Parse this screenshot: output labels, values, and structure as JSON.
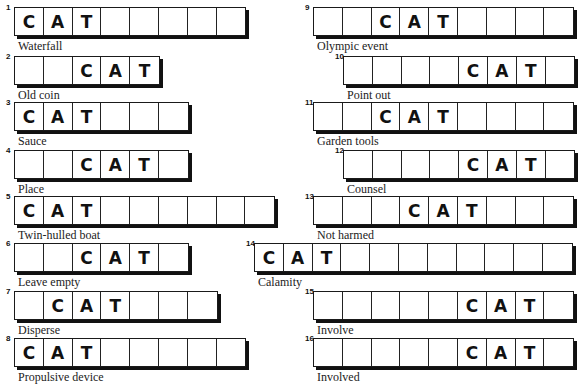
{
  "puzzle": {
    "entries": [
      {
        "number": "1",
        "clue": "Waterfall",
        "length": 8,
        "cat_start": 0,
        "x": 14,
        "y": 7
      },
      {
        "number": "2",
        "clue": "Old coin",
        "length": 5,
        "cat_start": 2,
        "x": 14,
        "y": 56
      },
      {
        "number": "3",
        "clue": "Sauce",
        "length": 6,
        "cat_start": 0,
        "x": 14,
        "y": 102
      },
      {
        "number": "4",
        "clue": "Place",
        "length": 6,
        "cat_start": 2,
        "x": 14,
        "y": 150
      },
      {
        "number": "5",
        "clue": "Twin-hulled boat",
        "length": 9,
        "cat_start": 0,
        "x": 14,
        "y": 196
      },
      {
        "number": "6",
        "clue": "Leave empty",
        "length": 6,
        "cat_start": 2,
        "x": 14,
        "y": 243
      },
      {
        "number": "7",
        "clue": "Disperse",
        "length": 7,
        "cat_start": 1,
        "x": 14,
        "y": 291
      },
      {
        "number": "8",
        "clue": "Propulsive device",
        "length": 8,
        "cat_start": 0,
        "x": 14,
        "y": 338
      },
      {
        "number": "9",
        "clue": "Olympic event",
        "length": 9,
        "cat_start": 2,
        "x": 313,
        "y": 7
      },
      {
        "number": "10",
        "clue": "Point out",
        "length": 8,
        "cat_start": 4,
        "x": 343,
        "y": 56
      },
      {
        "number": "11",
        "clue": "Garden tools",
        "length": 9,
        "cat_start": 2,
        "x": 313,
        "y": 102
      },
      {
        "number": "12",
        "clue": "Counsel",
        "length": 8,
        "cat_start": 4,
        "x": 343,
        "y": 150
      },
      {
        "number": "13",
        "clue": "Not harmed",
        "length": 9,
        "cat_start": 3,
        "x": 313,
        "y": 196
      },
      {
        "number": "14",
        "clue": "Calamity",
        "length": 11,
        "cat_start": 0,
        "x": 254,
        "y": 243
      },
      {
        "number": "15",
        "clue": "Involve",
        "length": 9,
        "cat_start": 5,
        "x": 313,
        "y": 291
      },
      {
        "number": "16",
        "clue": "Involved",
        "length": 9,
        "cat_start": 5,
        "x": 313,
        "y": 338
      }
    ],
    "given_letters": [
      "C",
      "A",
      "T"
    ]
  }
}
